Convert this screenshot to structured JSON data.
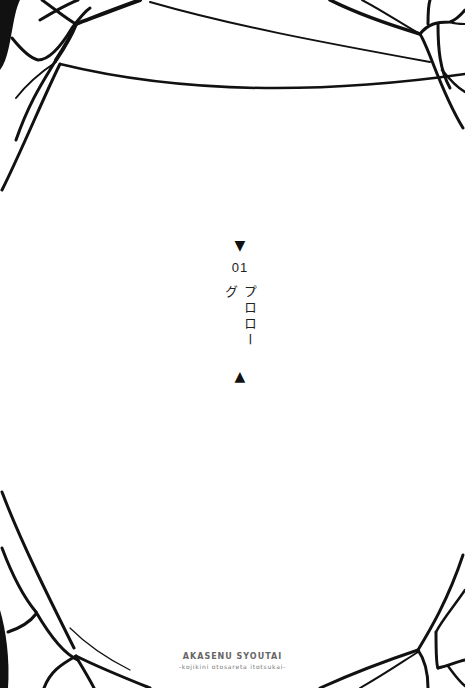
{
  "page": {
    "type": "chapter-title-page",
    "background_color": "#ffffff",
    "ink_color": "#111111"
  },
  "chapter": {
    "marker_top_icon": "triangle-down",
    "marker_top_glyph": "▼",
    "number": "01",
    "title": "プロローグ",
    "marker_bottom_icon": "triangle-up",
    "marker_bottom_glyph": "▲"
  },
  "footer": {
    "series_title": "AKASENU SYOUTAI",
    "series_subtitle": "-kojikini otosareta itotsukai-"
  },
  "decoration": {
    "style": "black web/thread lines framing corners",
    "corners": [
      "top-left",
      "top-right",
      "bottom-left",
      "bottom-right"
    ]
  }
}
